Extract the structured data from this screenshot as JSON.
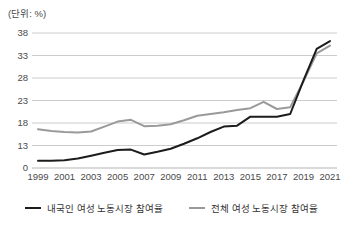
{
  "unit_label": "(단위: %)",
  "colors": {
    "series_domestic": "#1c1c1c",
    "series_total": "#9a9a9a",
    "gridline": "#cccccc",
    "axis_line": "#b5b5b5",
    "axis_text": "#4a4a4a",
    "background": "#ffffff"
  },
  "legend": {
    "domestic_label": "내국인 여성 노동시장 참여율",
    "total_label": "전체 여성 노동시장 참여율"
  },
  "chart_data": {
    "type": "line",
    "title": "",
    "unit_note": "(단위: %)",
    "x": [
      1999,
      2000,
      2001,
      2002,
      2003,
      2004,
      2005,
      2006,
      2007,
      2008,
      2009,
      2010,
      2011,
      2012,
      2013,
      2014,
      2015,
      2016,
      2017,
      2018,
      2019,
      2020,
      2021
    ],
    "x_tick_labels": [
      "1999",
      "2001",
      "2003",
      "2005",
      "2007",
      "2009",
      "2011",
      "2013",
      "2015",
      "2017",
      "2019",
      "2021"
    ],
    "y_tick_labels_top_to_bottom": [
      "38",
      "33",
      "28",
      "23",
      "18",
      "13",
      "0"
    ],
    "ylim_plotted": [
      8,
      38
    ],
    "grid": "horizontal-only",
    "legend_position": "bottom",
    "series": [
      {
        "name": "전체 여성 노동시장 참여율",
        "color": "#9a9a9a",
        "values": [
          16.6,
          16.2,
          16.0,
          15.9,
          16.1,
          17.2,
          18.3,
          18.7,
          17.3,
          17.4,
          17.7,
          18.6,
          19.6,
          20.0,
          20.4,
          20.9,
          21.3,
          22.7,
          21.1,
          21.5,
          27.3,
          33.5,
          35.2
        ]
      },
      {
        "name": "내국인 여성 노동시장 참여율",
        "color": "#1c1c1c",
        "values": [
          9.6,
          9.6,
          9.7,
          10.1,
          10.7,
          11.4,
          12.0,
          12.1,
          11.0,
          11.6,
          12.3,
          13.4,
          14.6,
          16.0,
          17.2,
          17.4,
          19.4,
          19.4,
          19.4,
          20.0,
          27.5,
          34.5,
          36.2
        ]
      }
    ]
  }
}
